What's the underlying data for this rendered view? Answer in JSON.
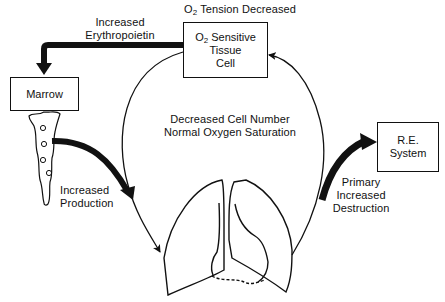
{
  "diagram": {
    "top_label": {
      "prefix": "O",
      "sub": "2",
      "suffix": " Tension Decreased"
    },
    "nodes": {
      "o2_cell": {
        "line1_prefix": "O",
        "line1_sub": "2",
        "line1_suffix": " Sensitive",
        "line2": "Tissue",
        "line3": "Cell"
      },
      "marrow": {
        "label": "Marrow"
      },
      "re_system": {
        "line1": "R.E.",
        "line2": "System"
      }
    },
    "edges": {
      "erythropoietin": {
        "line1": "Increased",
        "line2": "Erythropoietin"
      },
      "production": {
        "line1": "Increased",
        "line2": "Production"
      },
      "destruction": {
        "line1": "Primary",
        "line2": "Increased",
        "line3": "Destruction"
      }
    },
    "center": {
      "line1": "Decreased Cell Number",
      "line2": "Normal Oxygen Saturation"
    },
    "colors": {
      "ink": "#111111",
      "background": "#ffffff"
    }
  }
}
